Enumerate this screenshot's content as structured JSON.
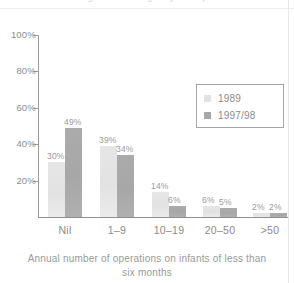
{
  "figure": {
    "cropped_title": "arising in an emergency or unplanned situation",
    "background_color": "#ffffff"
  },
  "legend": {
    "position": "upper-right",
    "entries": [
      {
        "label": "1989",
        "swatch_name": "legend-swatch-1989",
        "color": "#e2e2e2"
      },
      {
        "label": "1997/98",
        "swatch_name": "legend-swatch-1997-98",
        "color": "#a7a7a7"
      }
    ]
  },
  "axes": {
    "y_tick_labels": [
      "100%",
      "80%",
      "60%",
      "40%",
      "20%"
    ],
    "y_tick_values": [
      100,
      80,
      60,
      40,
      20
    ],
    "x_caption_line1": "Annual number of operations on infants of less than",
    "x_caption_line2": "six months"
  },
  "chart_data": {
    "type": "bar",
    "title": "",
    "xlabel": "Annual number of operations on infants of less than six months",
    "ylabel": "",
    "ylim": [
      0,
      100
    ],
    "grid": false,
    "legend_position": "upper right",
    "categories": [
      "Nil",
      "1–9",
      "10–19",
      "20–50",
      ">50"
    ],
    "series": [
      {
        "name": "1989",
        "color": "#e2e2e2",
        "values": [
          30,
          39,
          14,
          6,
          2
        ],
        "value_labels": [
          "30%",
          "39%",
          "14%",
          "6%",
          "2%"
        ]
      },
      {
        "name": "1997/98",
        "color": "#a7a7a7",
        "values": [
          49,
          34,
          6,
          5,
          2
        ],
        "value_labels": [
          "49%",
          "34%",
          "6%",
          "5%",
          "2%"
        ]
      }
    ]
  }
}
